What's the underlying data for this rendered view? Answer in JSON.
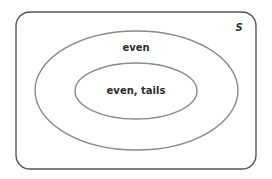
{
  "diagram": {
    "type": "venn",
    "universe": {
      "label": "S",
      "x": 16,
      "y": 12,
      "width": 240,
      "height": 157,
      "corner_radius": 14,
      "stroke": "#555555"
    },
    "sets": [
      {
        "label": "even",
        "cx": 136.5,
        "cy": 90.5,
        "rx": 101.5,
        "ry": 59.5,
        "stroke": "#8a8a8a",
        "label_x": 136,
        "label_y": 47
      },
      {
        "label": "even, tails",
        "cx": 136,
        "cy": 91,
        "rx": 61,
        "ry": 28,
        "stroke": "#8a8a8a",
        "label_x": 136,
        "label_y": 90
      }
    ],
    "relationship": "even, tails ⊂ even ⊂ S"
  }
}
